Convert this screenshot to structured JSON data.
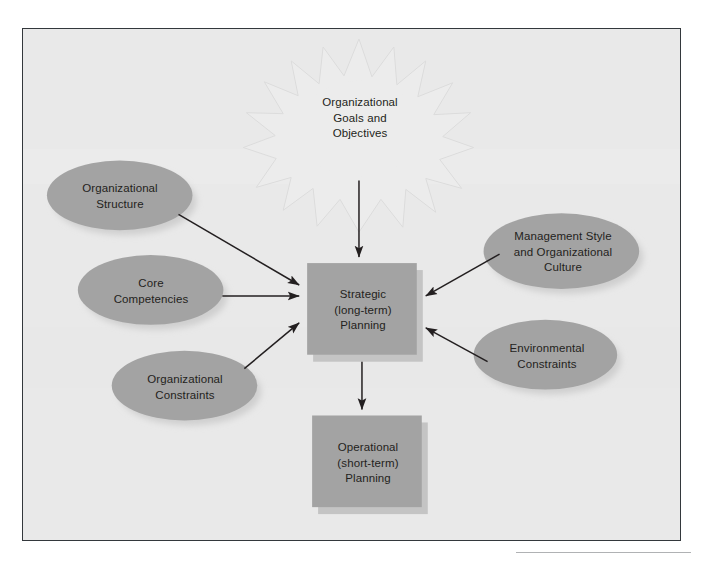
{
  "figure": {
    "background_color": "#e9e9e9",
    "border_color": "#33383c",
    "page_color": "#ffffff"
  },
  "palette": {
    "shape_fill": "#a3a3a3",
    "shape_fill_dark": "#9a9a9a",
    "shape_shadow": "#c9c9c9",
    "starburst_fill": "#ececec",
    "starburst_stroke": "#dcdcdc",
    "arrow_color": "#231f20",
    "text_color": "#231f20",
    "rule_color": "#b0b2b4"
  },
  "diagram": {
    "type": "influence-diagram",
    "nodes": [
      {
        "id": "organizational-goals",
        "shape": "starburst",
        "label": "Organizational\nGoals and\nObjectives",
        "lines": [
          "Organizational",
          "Goals and",
          "Objectives"
        ],
        "cx": 337,
        "cy": 92,
        "rx": 98,
        "ry": 82
      },
      {
        "id": "organizational-structure",
        "shape": "ellipse",
        "label": "Organizational\nStructure",
        "lines": [
          "Organizational",
          "Structure"
        ],
        "cx": 97,
        "cy": 167,
        "rx": 73,
        "ry": 35
      },
      {
        "id": "core-competencies",
        "shape": "ellipse",
        "label": "Core\nCompetencies",
        "lines": [
          "Core",
          "Competencies"
        ],
        "cx": 128,
        "cy": 262,
        "rx": 73,
        "ry": 35
      },
      {
        "id": "organizational-constraints",
        "shape": "ellipse",
        "label": "Organizational\nConstraints",
        "lines": [
          "Organizational",
          "Constraints"
        ],
        "cx": 162,
        "cy": 358,
        "rx": 73,
        "ry": 35
      },
      {
        "id": "management-style",
        "shape": "ellipse",
        "label": "Management Style\nand Organizational\nCulture",
        "lines": [
          "Management Style",
          "and Organizational",
          "Culture"
        ],
        "cx": 540,
        "cy": 223,
        "rx": 78,
        "ry": 38
      },
      {
        "id": "environmental-constraints",
        "shape": "ellipse",
        "label": "Environmental\nConstraints",
        "lines": [
          "Environmental",
          "Constraints"
        ],
        "cx": 524,
        "cy": 327,
        "rx": 72,
        "ry": 35
      },
      {
        "id": "strategic-planning",
        "shape": "rectangle",
        "label": "Strategic\n(long-term)\nPlanning",
        "lines": [
          "Strategic",
          "(long-term)",
          "Planning"
        ],
        "x": 285,
        "y": 235,
        "width": 110,
        "height": 92
      },
      {
        "id": "operational-planning",
        "shape": "rectangle",
        "label": "Operational\n(short-term)\nPlanning",
        "lines": [
          "Operational",
          "(short-term)",
          "Planning"
        ],
        "x": 290,
        "y": 388,
        "width": 110,
        "height": 92
      }
    ],
    "edges": [
      {
        "id": "goals-to-strategic",
        "from": "organizational-goals",
        "to": "strategic-planning",
        "direction": "down"
      },
      {
        "id": "structure-to-strategic",
        "from": "organizational-structure",
        "to": "strategic-planning",
        "direction": "down-right"
      },
      {
        "id": "competencies-to-strategic",
        "from": "core-competencies",
        "to": "strategic-planning",
        "direction": "right"
      },
      {
        "id": "constraints-to-strategic",
        "from": "organizational-constraints",
        "to": "strategic-planning",
        "direction": "up-right"
      },
      {
        "id": "management-to-strategic",
        "from": "management-style",
        "to": "strategic-planning",
        "direction": "down-left"
      },
      {
        "id": "environmental-to-strategic",
        "from": "environmental-constraints",
        "to": "strategic-planning",
        "direction": "up-left"
      },
      {
        "id": "strategic-to-operational",
        "from": "strategic-planning",
        "to": "operational-planning",
        "direction": "down"
      }
    ]
  }
}
